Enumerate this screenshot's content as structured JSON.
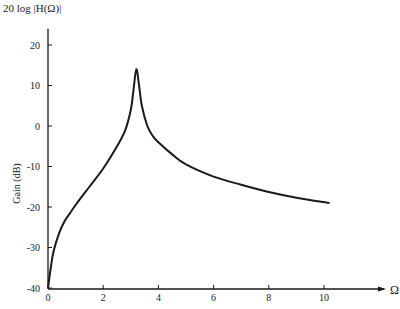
{
  "chart_data": {
    "type": "line",
    "title": "20 log |H(Ω)|",
    "xlabel": "Ω",
    "ylabel": "Gain (dB)",
    "xlim": [
      0,
      12
    ],
    "ylim": [
      -40,
      24
    ],
    "grid": false,
    "legend": null,
    "x_ticks": [
      "0",
      "2",
      "4",
      "6",
      "8",
      "10"
    ],
    "y_ticks": [
      "20",
      "10",
      "0",
      "-10",
      "-20",
      "-30",
      "-40"
    ],
    "series": [
      {
        "name": "Gain",
        "x": [
          0,
          0.1,
          0.2,
          0.4,
          0.6,
          0.8,
          1.0,
          1.5,
          2.0,
          2.5,
          2.8,
          3.0,
          3.1,
          3.2,
          3.3,
          3.4,
          3.6,
          3.8,
          4.0,
          4.5,
          5.0,
          6.0,
          7.0,
          8.0,
          9.0,
          10.2
        ],
        "values": [
          -40,
          -35,
          -31,
          -26.5,
          -23.5,
          -21.5,
          -19.5,
          -15,
          -10.5,
          -5,
          -1,
          4,
          9,
          14,
          10,
          5,
          0,
          -2.5,
          -4,
          -7,
          -9.5,
          -12.5,
          -14.5,
          -16.3,
          -17.7,
          -19
        ]
      }
    ]
  },
  "labels": {
    "title": "20 log |H(Ω)|",
    "ylabel": "Gain (dB)",
    "xunit": "Ω"
  }
}
